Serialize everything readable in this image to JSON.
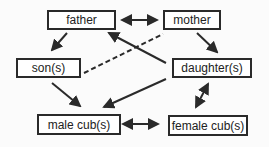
{
  "nodes": {
    "father": {
      "label": "father"
    },
    "mother": {
      "label": "mother"
    },
    "son": {
      "label": "son(s)"
    },
    "daughter": {
      "label": "daughter(s)"
    },
    "male_cub": {
      "label": "male cub(s)"
    },
    "female_cub": {
      "label": "female cub(s)"
    }
  },
  "edges": [
    {
      "from": "father",
      "to": "mother",
      "type": "bidirectional"
    },
    {
      "from": "father",
      "to": "son",
      "type": "directed"
    },
    {
      "from": "mother",
      "to": "daughter",
      "type": "directed"
    },
    {
      "from": "daughter",
      "to": "father",
      "type": "directed"
    },
    {
      "from": "son",
      "to": "mother",
      "type": "dashed"
    },
    {
      "from": "son",
      "to": "male_cub",
      "type": "directed"
    },
    {
      "from": "daughter",
      "to": "male_cub",
      "type": "directed"
    },
    {
      "from": "daughter",
      "to": "female_cub",
      "type": "bidirectional"
    },
    {
      "from": "male_cub",
      "to": "female_cub",
      "type": "bidirectional"
    }
  ],
  "colors": {
    "line": "#2a2a2a",
    "background": "#fbfbfb"
  }
}
